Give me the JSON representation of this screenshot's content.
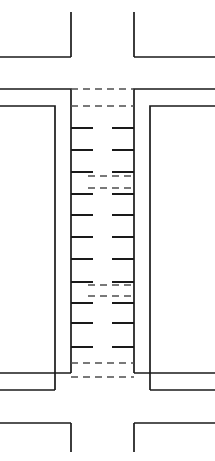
{
  "diagram": {
    "canvas": {
      "width": 215,
      "height": 461
    },
    "colors": {
      "background": "#ffffff",
      "solid_stroke": "#1a1a1a",
      "dashed_stroke": "#4d4d4d"
    },
    "geometry": {
      "left_outer_x": 71,
      "left_inner_x": 55,
      "right_outer_x": 134,
      "right_inner_x": 150,
      "north_leg_end_y": 12,
      "upper_far_edge_y": 57,
      "upper_outer_edge_y": 89,
      "upper_inner_edge_y": 106,
      "lower_inner_edge_y": 373,
      "lower_outer_edge_y": 390,
      "lower_far_edge_y": 423,
      "south_leg_end_y": 452,
      "tick_length_left": 22,
      "tick_length_right": 22
    },
    "corner_returns": [
      {
        "name": "north-west-return",
        "h_from_x": 0,
        "h_to_x": 71,
        "h_y": 57,
        "v_x": 71,
        "v_from_y": 12,
        "v_to_y": 57
      },
      {
        "name": "north-east-return",
        "h_from_x": 134,
        "h_to_x": 215,
        "h_y": 57,
        "v_x": 134,
        "v_from_y": 12,
        "v_to_y": 57
      },
      {
        "name": "south-west-return",
        "h_from_x": 0,
        "h_to_x": 71,
        "h_y": 423,
        "v_x": 71,
        "v_from_y": 423,
        "v_to_y": 452
      },
      {
        "name": "south-east-return",
        "h_from_x": 134,
        "h_to_x": 215,
        "h_y": 423,
        "v_x": 134,
        "v_from_y": 423,
        "v_to_y": 452
      }
    ],
    "edge_polylines": [
      {
        "name": "north-west-outer-edge",
        "points": "0,89 71,89 71,373"
      },
      {
        "name": "north-west-inner-edge",
        "points": "0,106 55,106 55,390"
      },
      {
        "name": "north-east-outer-edge",
        "points": "215,89 134,89 134,373"
      },
      {
        "name": "north-east-inner-edge",
        "points": "215,106 150,106 150,390"
      },
      {
        "name": "south-west-outer-edge",
        "points": "0,373 71,373"
      },
      {
        "name": "south-west-inner-edge",
        "points": "0,390 55,390"
      },
      {
        "name": "south-east-outer-edge",
        "points": "215,373 134,373"
      },
      {
        "name": "south-east-inner-edge",
        "points": "215,390 150,390"
      }
    ],
    "left_ticks_y": [
      128,
      150,
      172,
      194,
      215,
      237,
      259,
      282,
      303,
      323,
      347
    ],
    "right_ticks_y": [
      128,
      150,
      172,
      194,
      215,
      237,
      259,
      282,
      303,
      323,
      347
    ],
    "dashed_lines": [
      {
        "name": "stop-bar-extension-north-outer",
        "x1": 71,
        "x2": 134,
        "y": 89
      },
      {
        "name": "stop-bar-extension-north-inner",
        "x1": 71,
        "x2": 134,
        "y": 106
      },
      {
        "name": "lane-extension-upper-right",
        "x1": 88,
        "x2": 134,
        "y": 176
      },
      {
        "name": "lane-extension-upper-left",
        "x1": 88,
        "x2": 134,
        "y": 188
      },
      {
        "name": "lane-extension-lower-right",
        "x1": 88,
        "x2": 134,
        "y": 285
      },
      {
        "name": "lane-extension-lower-left",
        "x1": 88,
        "x2": 134,
        "y": 296
      },
      {
        "name": "stop-bar-extension-south-inner",
        "x1": 71,
        "x2": 134,
        "y": 363
      },
      {
        "name": "stop-bar-extension-south-outer",
        "x1": 71,
        "x2": 134,
        "y": 377
      }
    ],
    "dash_pattern": "7 5"
  }
}
